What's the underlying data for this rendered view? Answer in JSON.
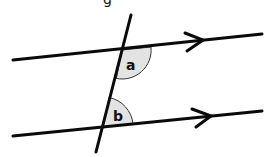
{
  "diagram": {
    "title_fragment": "g",
    "colors": {
      "line": "#0a0a0a",
      "angle_fill": "#e3e3e3",
      "angle_stroke": "#333333",
      "background": "#ffffff"
    },
    "parallel_lines": [
      {
        "name": "top-line",
        "x1": 13,
        "y1": 60,
        "x2": 262,
        "y2": 34,
        "arrow_at": [
          200,
          40.5
        ]
      },
      {
        "name": "bottom-line",
        "x1": 13,
        "y1": 136,
        "x2": 262,
        "y2": 111,
        "arrow_at": [
          207,
          116.5
        ]
      }
    ],
    "transversal": {
      "x1": 131,
      "y1": 15,
      "x2": 96,
      "y2": 152
    },
    "angles": [
      {
        "label": "a",
        "vertex": [
          122,
          50
        ],
        "position": "below top line, right of transversal"
      },
      {
        "label": "b",
        "vertex": [
          103,
          127
        ],
        "position": "above bottom line, right of transversal"
      }
    ]
  }
}
